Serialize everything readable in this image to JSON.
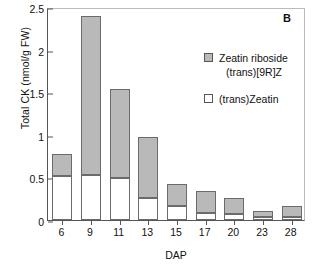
{
  "panel": {
    "label": "B"
  },
  "legend": {
    "position": "inside-top-right",
    "entries": [
      {
        "marker": "filled-gray-square",
        "line1": "Zeatin riboside",
        "line2": "(trans)[9R]Z"
      },
      {
        "marker": "open-white-square",
        "line1": "(trans)Zeatin",
        "line2": ""
      }
    ]
  },
  "axes": {
    "ylabel": "Total CK (nmol/g FW)",
    "xlabel": "DAP",
    "yticks": [
      "0",
      "0.5",
      "1",
      "1.5",
      "2",
      "2.5"
    ],
    "ytick_values": [
      0,
      0.5,
      1,
      1.5,
      2,
      2.5
    ]
  },
  "chart_data": {
    "type": "bar",
    "title": "",
    "subtitle": "",
    "xlabel": "DAP",
    "ylabel": "Total CK (nmol/g FW)",
    "categories": [
      "6",
      "9",
      "11",
      "13",
      "15",
      "17",
      "20",
      "23",
      "28"
    ],
    "ylim": [
      0,
      2.5
    ],
    "xlim_note": "categorical, 9 bars evenly spaced",
    "grid": false,
    "stacked": true,
    "legend_position": "inside upper right",
    "series": [
      {
        "name": "(trans)Zeatin",
        "color": "#ffffff",
        "values": [
          0.52,
          0.53,
          0.49,
          0.26,
          0.17,
          0.08,
          0.07,
          0.03,
          0.03
        ]
      },
      {
        "name": "Zeatin riboside (trans)[9R]Z",
        "color": "#b9b9b9",
        "values": [
          0.26,
          1.86,
          1.05,
          0.71,
          0.25,
          0.26,
          0.19,
          0.08,
          0.14
        ]
      }
    ],
    "totals": [
      0.78,
      2.39,
      1.54,
      0.97,
      0.42,
      0.34,
      0.26,
      0.11,
      0.17
    ],
    "annotations": [
      {
        "text": "B",
        "position": "top-right"
      }
    ]
  },
  "colors": {
    "riboside_fill": "#b9b9b9",
    "zeatin_fill": "#ffffff",
    "bar_edge": "#6b6b6b",
    "axis": "#555555"
  }
}
